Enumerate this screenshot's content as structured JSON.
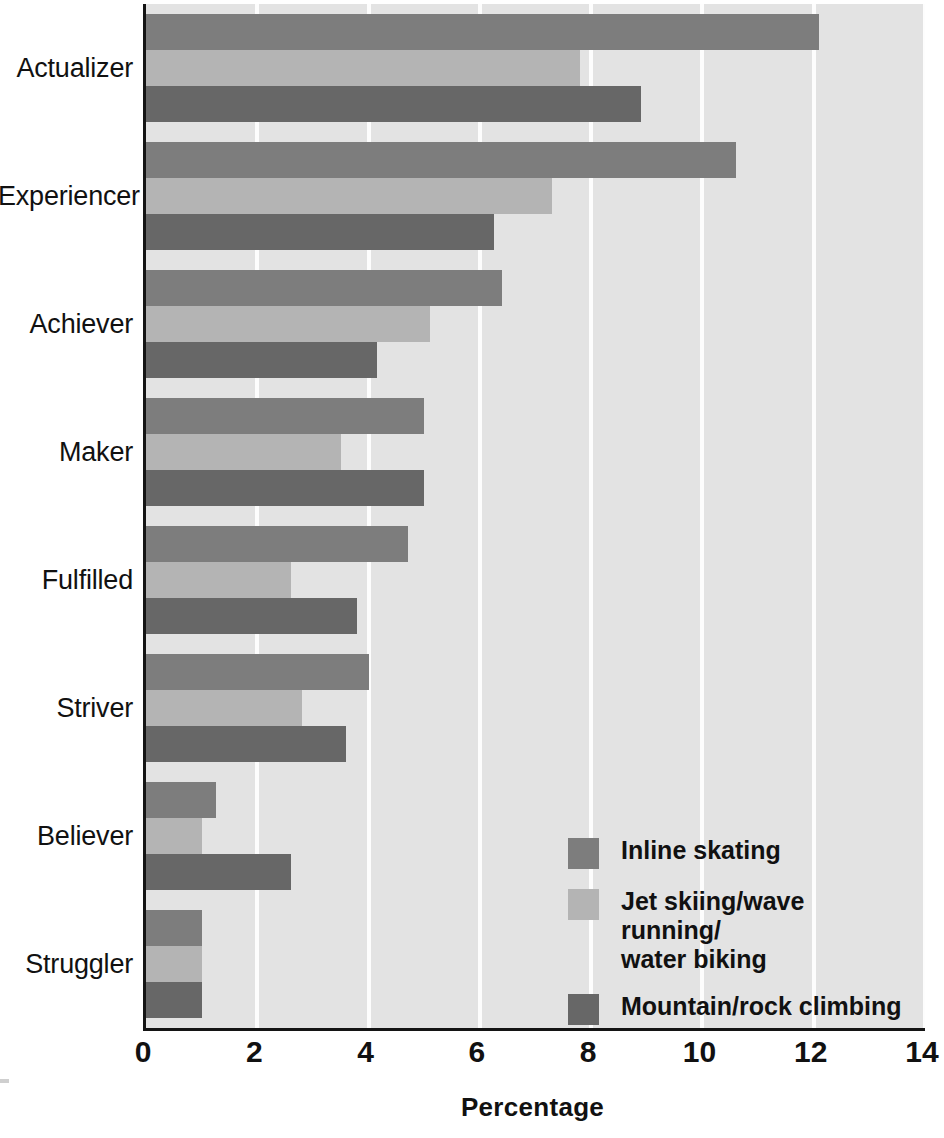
{
  "chart_data": {
    "type": "bar",
    "orientation": "horizontal",
    "title": "",
    "xlabel": "Percentage",
    "ylabel": "",
    "xlim": [
      0,
      14
    ],
    "xticks": [
      0,
      2,
      4,
      6,
      8,
      10,
      12,
      14
    ],
    "grid": "vertical-white-gridlines",
    "legend_position": "inside-lower-right",
    "categories": [
      "Actualizer",
      "Experiencer",
      "Achiever",
      "Maker",
      "Fulfilled",
      "Striver",
      "Believer",
      "Struggler"
    ],
    "series": [
      {
        "name": "Inline skating",
        "color": "#7d7d7d",
        "values": [
          12.1,
          10.6,
          6.4,
          5.0,
          4.7,
          4.0,
          1.25,
          1.0
        ]
      },
      {
        "name": "Jet skiing/wave running/\nwater biking",
        "color": "#b4b4b4",
        "values": [
          7.8,
          7.3,
          5.1,
          3.5,
          2.6,
          2.8,
          1.0,
          1.0
        ]
      },
      {
        "name": "Mountain/rock climbing",
        "color": "#676767",
        "values": [
          8.9,
          6.25,
          4.15,
          5.0,
          3.8,
          3.6,
          2.6,
          1.0
        ]
      }
    ]
  },
  "axis": {
    "x_title": "Percentage",
    "tick_labels": [
      "0",
      "2",
      "4",
      "6",
      "8",
      "10",
      "12",
      "14"
    ]
  },
  "legend": {
    "entries": [
      {
        "label": "Inline skating",
        "color": "#7d7d7d"
      },
      {
        "label": "Jet skiing/wave running/\nwater biking",
        "color": "#b4b4b4"
      },
      {
        "label": "Mountain/rock climbing",
        "color": "#676767"
      }
    ]
  },
  "colors": {
    "plot_background": "#e3e3e3",
    "gridline": "#fdfdfd",
    "axis_line": "#141414",
    "text": "#111111",
    "series_1": "#7d7d7d",
    "series_2": "#b4b4b4",
    "series_3": "#676767"
  }
}
